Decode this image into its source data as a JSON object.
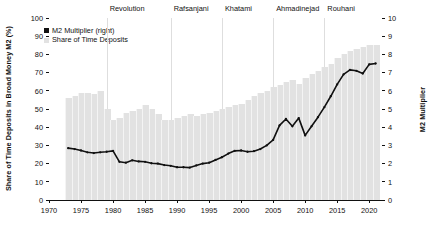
{
  "chart_data": {
    "type": "bar",
    "title": "",
    "xlabel": "",
    "ylabel": "Share of Time Deposits in Broad Money M2 (%)",
    "ylabel_right": "M2 Multiplier",
    "xlim": [
      1970,
      2022
    ],
    "ylim": [
      0,
      100
    ],
    "ylim_right": [
      0,
      10
    ],
    "grid": false,
    "legend_position": "upper left",
    "legend": [
      {
        "label": "M2 Multiplier (right)",
        "marker": "square",
        "color": "#111111"
      },
      {
        "label": "Share of Time Deposits",
        "marker": "bar",
        "color": "#e2e2e2"
      }
    ],
    "xticks": [
      1970,
      1975,
      1980,
      1985,
      1990,
      1995,
      2000,
      2005,
      2010,
      2015,
      2020
    ],
    "yticks_left": [
      0,
      10,
      20,
      30,
      40,
      50,
      60,
      70,
      80,
      90,
      100
    ],
    "yticks_right": [
      0,
      1,
      2,
      3,
      4,
      5,
      6,
      7,
      8,
      9,
      10
    ],
    "annotations": [
      {
        "label": "Revolution",
        "x": 1979
      },
      {
        "label": "Rafsanjani",
        "x": 1989
      },
      {
        "label": "Khatami",
        "x": 1997
      },
      {
        "label": "Ahmadinejad",
        "x": 2005
      },
      {
        "label": "Rouhani",
        "x": 2013
      }
    ],
    "x": [
      1973,
      1974,
      1975,
      1976,
      1977,
      1978,
      1979,
      1980,
      1981,
      1982,
      1983,
      1984,
      1985,
      1986,
      1987,
      1988,
      1989,
      1990,
      1991,
      1992,
      1993,
      1994,
      1995,
      1996,
      1997,
      1998,
      1999,
      2000,
      2001,
      2002,
      2003,
      2004,
      2005,
      2006,
      2007,
      2008,
      2009,
      2010,
      2011,
      2012,
      2013,
      2014,
      2015,
      2016,
      2017,
      2018,
      2019,
      2020,
      2021
    ],
    "series": [
      {
        "name": "Share of Time Deposits",
        "axis": "left",
        "type": "bar",
        "color": "#e2e2e2",
        "values": [
          56,
          57,
          59,
          59,
          58,
          60,
          50,
          44,
          45,
          48,
          49,
          50,
          52,
          50,
          47,
          44,
          44,
          45,
          46,
          47,
          46,
          47,
          48,
          49,
          50,
          51,
          52,
          53,
          55,
          57,
          59,
          60,
          62,
          63,
          65,
          66,
          64,
          67,
          69,
          71,
          73,
          75,
          78,
          80,
          82,
          83,
          84,
          85,
          85
        ]
      },
      {
        "name": "M2 Multiplier (right)",
        "axis": "right",
        "type": "line",
        "color": "#111111",
        "values": [
          2.85,
          2.8,
          2.72,
          2.62,
          2.58,
          2.62,
          2.65,
          2.7,
          2.1,
          2.05,
          2.18,
          2.12,
          2.1,
          2.02,
          2.0,
          1.92,
          1.88,
          1.8,
          1.8,
          1.78,
          1.9,
          2.0,
          2.05,
          2.2,
          2.35,
          2.55,
          2.7,
          2.72,
          2.65,
          2.68,
          2.8,
          3.0,
          3.3,
          4.1,
          4.45,
          4.05,
          4.5,
          3.55,
          4.05,
          4.55,
          5.1,
          5.7,
          6.35,
          6.9,
          7.15,
          7.1,
          6.95,
          7.45,
          7.5
        ]
      }
    ]
  }
}
